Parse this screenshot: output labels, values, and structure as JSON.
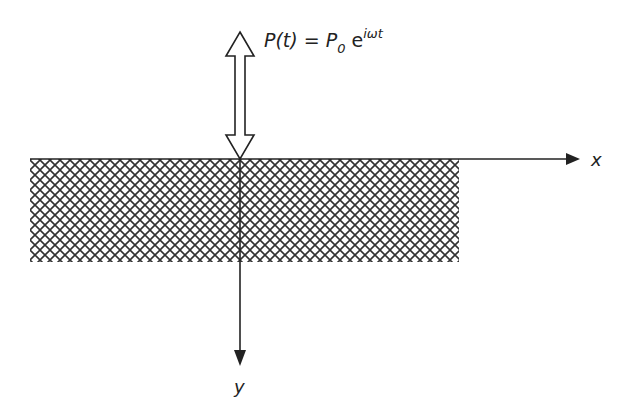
{
  "diagram": {
    "force_label": {
      "lhs": "P(t) = P",
      "subscript": "0",
      "base": " e",
      "exponent": "iωt"
    },
    "axes": {
      "x_label": "x",
      "y_label": "y"
    },
    "colors": {
      "line": "#222222",
      "hatch": "#333333",
      "background": "#ffffff"
    }
  }
}
